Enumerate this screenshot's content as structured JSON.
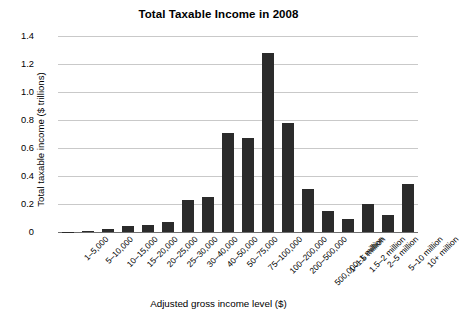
{
  "chart_data": {
    "type": "bar",
    "title": "Total Taxable Income in 2008",
    "xlabel": "Adjusted gross income level ($)",
    "ylabel": "Total taxable income ($ trillions)",
    "ylim": [
      0,
      1.4
    ],
    "ytick_labels": [
      "1.4",
      "1.2",
      "1.0",
      "0.8",
      "0.6",
      "0.4",
      "0.2",
      "0"
    ],
    "ytick_values": [
      1.4,
      1.2,
      1.0,
      0.8,
      0.6,
      0.4,
      0.2,
      0
    ],
    "grid": true,
    "legend": null,
    "bar_color": "#2b2b2b",
    "grid_color": "#c9c9c9",
    "categories": [
      "1–5,000",
      "5–10,000",
      "10–15,000",
      "15–20,000",
      "20–25,000",
      "25–30,000",
      "30–40,000",
      "40–50,000",
      "50–75,000",
      "75–100,000",
      "100–200,000",
      "200–500,000",
      "500,000–1 million",
      "1–1.5 million",
      "1.5–2 million",
      "2–5 million",
      "5–10 million",
      "10+ million"
    ],
    "values": [
      0.003,
      0.01,
      0.02,
      0.04,
      0.05,
      0.07,
      0.23,
      0.25,
      0.71,
      0.67,
      1.28,
      0.78,
      0.31,
      0.15,
      0.09,
      0.2,
      0.12,
      0.34
    ]
  }
}
